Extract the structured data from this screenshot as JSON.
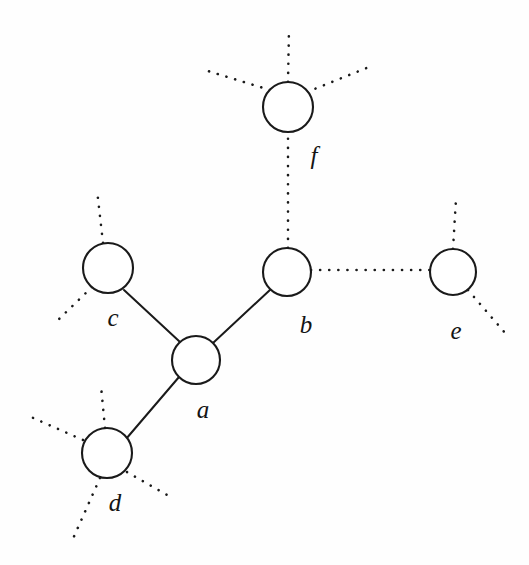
{
  "figure": {
    "type": "graph-diagram",
    "background_color": "#fefefe",
    "stroke_color": "#1a1a1a",
    "width": 529,
    "height": 565
  },
  "nodes": [
    {
      "id": "a",
      "label": "a",
      "cx": 196,
      "cy": 360,
      "r": 24,
      "label_x": 203,
      "label_y": 410
    },
    {
      "id": "b",
      "label": "b",
      "cx": 287,
      "cy": 272,
      "r": 24,
      "label_x": 306,
      "label_y": 325
    },
    {
      "id": "c",
      "label": "c",
      "cx": 108,
      "cy": 268,
      "r": 25,
      "label_x": 113,
      "label_y": 318
    },
    {
      "id": "d",
      "label": "d",
      "cx": 107,
      "cy": 453,
      "r": 25,
      "label_x": 115,
      "label_y": 503
    },
    {
      "id": "e",
      "label": "e",
      "cx": 453,
      "cy": 272,
      "r": 23,
      "label_x": 456,
      "label_y": 331
    },
    {
      "id": "f",
      "label": "f",
      "cx": 288,
      "cy": 107,
      "r": 25,
      "label_x": 314,
      "label_y": 156
    }
  ],
  "solid_edges": [
    {
      "from": "a",
      "to": "c",
      "x1": 180,
      "y1": 342,
      "x2": 124,
      "y2": 290
    },
    {
      "from": "a",
      "to": "b",
      "x1": 213,
      "y1": 343,
      "x2": 271,
      "y2": 289
    },
    {
      "from": "a",
      "to": "d",
      "x1": 179,
      "y1": 377,
      "x2": 126,
      "y2": 439
    }
  ],
  "dotted_edges": [
    {
      "from": "b",
      "to": "f",
      "x1": 288,
      "y1": 248,
      "x2": 288,
      "y2": 132
    },
    {
      "from": "b",
      "to": "e",
      "x1": 311,
      "y1": 270,
      "x2": 430,
      "y2": 270
    },
    {
      "from": "f",
      "to": "up",
      "x1": 288,
      "y1": 82,
      "x2": 289,
      "y2": 28
    },
    {
      "from": "f",
      "to": "up-left",
      "x1": 270,
      "y1": 90,
      "x2": 208,
      "y2": 71
    },
    {
      "from": "f",
      "to": "up-right",
      "x1": 307,
      "y1": 92,
      "x2": 369,
      "y2": 67
    },
    {
      "from": "c",
      "to": "up",
      "x1": 103,
      "y1": 243,
      "x2": 97,
      "y2": 190
    },
    {
      "from": "c",
      "to": "down-left",
      "x1": 92,
      "y1": 287,
      "x2": 57,
      "y2": 321
    },
    {
      "from": "e",
      "to": "up",
      "x1": 453,
      "y1": 249,
      "x2": 456,
      "y2": 199
    },
    {
      "from": "e",
      "to": "down-right",
      "x1": 468,
      "y1": 290,
      "x2": 506,
      "y2": 334
    },
    {
      "from": "d",
      "to": "up",
      "x1": 105,
      "y1": 428,
      "x2": 101,
      "y2": 386
    },
    {
      "from": "d",
      "to": "left",
      "x1": 83,
      "y1": 440,
      "x2": 31,
      "y2": 417
    },
    {
      "from": "d",
      "to": "down-left",
      "x1": 100,
      "y1": 478,
      "x2": 72,
      "y2": 541
    },
    {
      "from": "d",
      "to": "down-right",
      "x1": 127,
      "y1": 472,
      "x2": 174,
      "y2": 499
    }
  ]
}
